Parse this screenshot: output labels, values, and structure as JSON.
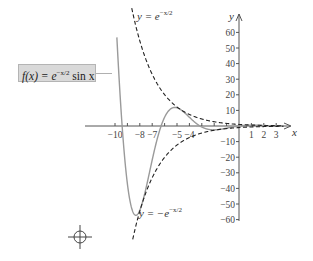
{
  "chart_data": {
    "type": "line",
    "title": "",
    "xlabel": "x",
    "ylabel": "y",
    "xlim": [
      -10.5,
      4
    ],
    "ylim": [
      -60,
      60
    ],
    "grid": false,
    "x_ticks": [
      -10,
      -8,
      -7,
      -5,
      -4,
      1,
      2,
      3
    ],
    "x_tick_marks": [
      -10,
      -9,
      -8,
      -7,
      -6,
      -5,
      -4,
      -3,
      -2,
      -1,
      1,
      2,
      3
    ],
    "y_ticks": [
      60,
      50,
      40,
      30,
      20,
      10,
      -10,
      -20,
      -30,
      -40,
      -50,
      -60
    ],
    "series": [
      {
        "name": "f(x) = e^(-x/2) sin x",
        "style": "solid",
        "color": "#9a9a9a",
        "x": [
          -9.5,
          -9,
          -8.5,
          -8.2,
          -8,
          -7.5,
          -7,
          -6.5,
          -6,
          -5.5,
          -5.176,
          -5,
          -4.5,
          -4,
          -3.5,
          -3,
          -2.5,
          -2,
          -1.5,
          -1,
          0,
          1,
          2,
          3
        ],
        "values": [
          8.7,
          -37.3,
          -55.6,
          -56.7,
          -54.0,
          -39.8,
          -21.7,
          -5.3,
          5.6,
          11.0,
          11.9,
          11.6,
          9.3,
          5.6,
          2.0,
          -0.6,
          -2.1,
          -2.5,
          -2.1,
          -1.4,
          0,
          0.51,
          0.33,
          0.03
        ]
      },
      {
        "name": "y = e^(-x/2)",
        "style": "dashed",
        "color": "#222222",
        "x": [
          -8.6,
          -8,
          -7,
          -6,
          -5,
          -4,
          -3,
          -2,
          -1,
          0,
          1,
          2,
          3
        ],
        "values": [
          73.7,
          54.6,
          33.1,
          20.1,
          12.2,
          7.4,
          4.5,
          2.7,
          1.6,
          1.0,
          0.61,
          0.37,
          0.22
        ]
      },
      {
        "name": "y = -e^(-x/2)",
        "style": "dashed",
        "color": "#222222",
        "x": [
          -8.2,
          -8,
          -7,
          -6,
          -5,
          -4,
          -3,
          -2,
          -1,
          0,
          1,
          2,
          3
        ],
        "values": [
          -60.3,
          -54.6,
          -33.1,
          -20.1,
          -12.2,
          -7.4,
          -4.5,
          -2.7,
          -1.6,
          -1.0,
          -0.61,
          -0.37,
          -0.22
        ]
      }
    ],
    "annotations": [
      {
        "text": "f(x) = e^(-x/2) sin x",
        "boxed": true
      },
      {
        "text": "y = e^(-x/2)"
      },
      {
        "text": "y = -e^(-x/2)"
      }
    ]
  },
  "labels": {
    "x_axis": "x",
    "y_axis": "y",
    "fbox": {
      "lhs": "f(x) = e",
      "exp": "−x/2",
      "rhs": " sin x"
    },
    "upper": {
      "lhs": "y = e",
      "exp": "−x/2"
    },
    "lower": {
      "lhs": "y = −e",
      "exp": "−x/2"
    }
  },
  "layout": {
    "origin_px": [
      239,
      126
    ],
    "x_scale_px": 12.4,
    "y_scale_px": 1.56
  }
}
